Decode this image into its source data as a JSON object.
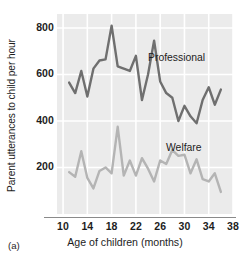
{
  "figure": {
    "panel_id": "(a)",
    "xlabel": "Age of children (months)",
    "ylabel": "Parent utterances to child per hour"
  },
  "chart_data": {
    "type": "line",
    "title": "",
    "xlabel": "Age of children (months)",
    "ylabel": "Parent utterances to child per hour",
    "xlim": [
      9,
      38
    ],
    "ylim": [
      0,
      860
    ],
    "xticks": [
      10,
      14,
      18,
      22,
      26,
      30,
      34,
      38
    ],
    "yticks": [
      200,
      400,
      600,
      800
    ],
    "grid": "both",
    "legend": "inline-annotations",
    "colors": {
      "professional": "#6f6f6f",
      "welfare": "#b4b4b4",
      "plot_background": "#ebebeb",
      "gridline": "#ffffff",
      "axis": "#8a8a8a",
      "text": "#1d1d1d"
    },
    "x": [
      11,
      12,
      13,
      14,
      15,
      16,
      17,
      18,
      19,
      20,
      21,
      22,
      23,
      24,
      25,
      26,
      27,
      28,
      29,
      30,
      31,
      32,
      33,
      34,
      35,
      36
    ],
    "series": [
      {
        "name": "Professional",
        "color": "#6f6f6f",
        "values": [
          565,
          520,
          615,
          505,
          625,
          660,
          665,
          810,
          635,
          625,
          615,
          680,
          490,
          600,
          745,
          570,
          520,
          500,
          400,
          465,
          420,
          390,
          490,
          545,
          470,
          535
        ]
      },
      {
        "name": "Welfare",
        "color": "#b4b4b4",
        "values": [
          180,
          160,
          270,
          155,
          110,
          185,
          200,
          175,
          375,
          165,
          230,
          165,
          240,
          195,
          140,
          230,
          215,
          275,
          250,
          255,
          175,
          235,
          150,
          140,
          175,
          95
        ]
      }
    ],
    "annotations": [
      {
        "text": "Professional",
        "x": 26.5,
        "y": 640
      },
      {
        "text": "Welfare",
        "x": 29.5,
        "y": 305
      }
    ]
  }
}
